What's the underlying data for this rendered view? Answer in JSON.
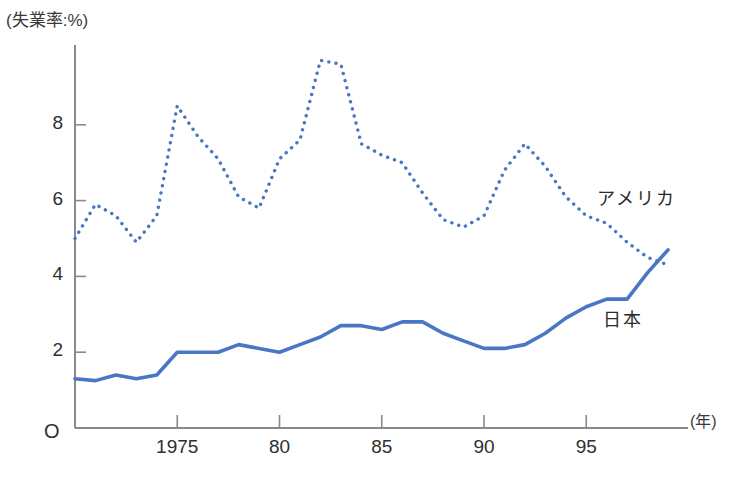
{
  "chart_data": {
    "type": "line",
    "title": "",
    "ylabel": "(失業率:%)",
    "xlabel": "(年)",
    "ylim": [
      0,
      10
    ],
    "xlim": [
      1970,
      1999
    ],
    "grid": false,
    "legend_position": "inline-right",
    "y_ticks": [
      "2",
      "4",
      "6",
      "8"
    ],
    "y_tick_values": [
      2,
      4,
      6,
      8
    ],
    "x_ticks": [
      "1975",
      "80",
      "85",
      "90",
      "95"
    ],
    "x_tick_values": [
      1975,
      1980,
      1985,
      1990,
      1995
    ],
    "origin_label": "O",
    "x": [
      1970,
      1971,
      1972,
      1973,
      1974,
      1975,
      1976,
      1977,
      1978,
      1979,
      1980,
      1981,
      1982,
      1983,
      1984,
      1985,
      1986,
      1987,
      1988,
      1989,
      1990,
      1991,
      1992,
      1993,
      1994,
      1995,
      1996,
      1997,
      1998,
      1999
    ],
    "series": [
      {
        "name": "アメリカ",
        "style": "dotted",
        "color": "#4a77c4",
        "values": [
          5.0,
          5.9,
          5.6,
          4.9,
          5.6,
          8.5,
          7.7,
          7.1,
          6.1,
          5.8,
          7.1,
          7.6,
          9.7,
          9.6,
          7.5,
          7.2,
          7.0,
          6.2,
          5.5,
          5.3,
          5.6,
          6.8,
          7.5,
          6.9,
          6.1,
          5.6,
          5.4,
          4.9,
          4.5,
          4.3
        ]
      },
      {
        "name": "日本",
        "style": "solid",
        "color": "#4a77c4",
        "values": [
          1.3,
          1.25,
          1.4,
          1.3,
          1.4,
          2.0,
          2.0,
          2.0,
          2.2,
          2.1,
          2.0,
          2.2,
          2.4,
          2.7,
          2.7,
          2.6,
          2.8,
          2.8,
          2.5,
          2.3,
          2.1,
          2.1,
          2.2,
          2.5,
          2.9,
          3.2,
          3.4,
          3.4,
          4.1,
          4.7
        ]
      }
    ]
  },
  "labels": {
    "y_unit": "(失業率:%)",
    "x_unit": "(年)",
    "origin": "O",
    "series_usa": "アメリカ",
    "series_japan": "日本"
  },
  "colors": {
    "line": "#4a77c4",
    "axis": "#8a8a8a",
    "text": "#2f2f2f"
  }
}
